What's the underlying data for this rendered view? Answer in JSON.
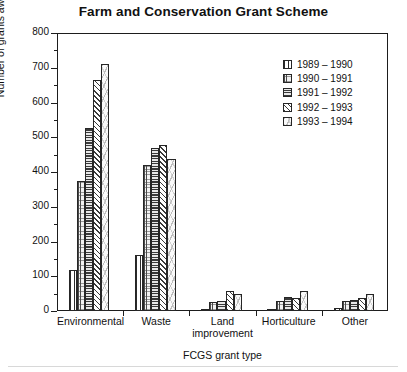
{
  "chart_data": {
    "type": "bar",
    "title": "Farm and Conservation Grant Scheme",
    "xlabel": "FCGS grant type",
    "ylabel": "Number of grants awarded",
    "ylim": [
      0,
      800
    ],
    "ytick_step": 100,
    "yticks": [
      "0",
      "100",
      "200",
      "300",
      "400",
      "500",
      "600",
      "700",
      "800"
    ],
    "minor_ytick_step": 50,
    "grid": false,
    "legend_position": "upper right",
    "categories": [
      "Environmental",
      "Waste",
      "Land improvement",
      "Horticulture",
      "Other"
    ],
    "category_lines": [
      [
        "Environmental"
      ],
      [
        "Waste"
      ],
      [
        "Land",
        "improvement"
      ],
      [
        "Horticulture"
      ],
      [
        "Other"
      ]
    ],
    "series": [
      {
        "name": "1989 – 1990",
        "pattern": "vertical-wide",
        "values": [
          118,
          160,
          5,
          2,
          8
        ]
      },
      {
        "name": "1990 – 1991",
        "pattern": "vertical-fine",
        "values": [
          375,
          420,
          25,
          28,
          28
        ]
      },
      {
        "name": "1991 – 1992",
        "pattern": "horizontal",
        "values": [
          527,
          470,
          28,
          40,
          33
        ]
      },
      {
        "name": "1992 – 1993",
        "pattern": "diagonal",
        "values": [
          665,
          478,
          58,
          38,
          38
        ]
      },
      {
        "name": "1993 – 1994",
        "pattern": "speckle",
        "values": [
          710,
          437,
          50,
          58,
          50
        ]
      }
    ]
  },
  "colors": {
    "axis": "#1d1d1d",
    "text": "#111111",
    "background": "#ffffff"
  }
}
